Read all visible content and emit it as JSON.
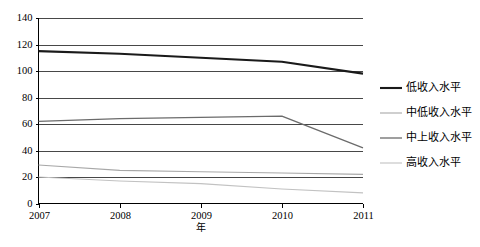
{
  "chart_data": {
    "type": "line",
    "title": "",
    "xlabel": "年",
    "ylabel": "",
    "categories": [
      "2007",
      "2008",
      "2009",
      "2010",
      "2011"
    ],
    "x": [
      2007,
      2008,
      2009,
      2010,
      2011
    ],
    "ylim": [
      0,
      140
    ],
    "yticks": [
      0,
      20,
      40,
      60,
      80,
      100,
      120,
      140
    ],
    "ytick_labels": [
      "0",
      "20",
      "40",
      "60",
      "80",
      "100",
      "120",
      "140"
    ],
    "grid": "horizontal",
    "legend_position": "right",
    "series": [
      {
        "name": "低收入水平",
        "values": [
          115,
          113,
          110,
          107,
          98
        ],
        "color": "#1a1a1a",
        "width": 2.1
      },
      {
        "name": "中低收入水平",
        "values": [
          29,
          25,
          24,
          23,
          22
        ],
        "color": "#a8a8a8",
        "width": 1.1
      },
      {
        "name": "中上收入水平",
        "values": [
          62,
          64,
          65,
          66,
          42
        ],
        "color": "#6b6b6b",
        "width": 1.3
      },
      {
        "name": "高收入水平",
        "values": [
          20,
          17,
          15,
          11,
          8
        ],
        "color": "#c2c2c2",
        "width": 1.1
      }
    ]
  },
  "axes": {
    "y_tick_0": "0",
    "y_tick_1": "20",
    "y_tick_2": "40",
    "y_tick_3": "60",
    "y_tick_4": "80",
    "y_tick_5": "100",
    "y_tick_6": "120",
    "y_tick_7": "140",
    "x_tick_0": "2007",
    "x_tick_1": "2008",
    "x_tick_2": "2009",
    "x_tick_3": "2010",
    "x_tick_4": "2011",
    "x_axis_title": "年"
  },
  "legend": {
    "items": [
      {
        "label": "低收入水平"
      },
      {
        "label": "中低收入水平"
      },
      {
        "label": "中上收入水平"
      },
      {
        "label": "高收入水平"
      }
    ]
  }
}
